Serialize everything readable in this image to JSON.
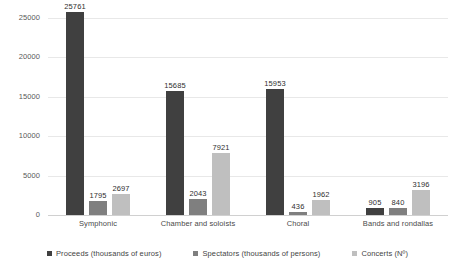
{
  "chart_data": {
    "type": "bar",
    "title": "",
    "subtitle": "",
    "xlabel": "",
    "ylabel": "",
    "ylim": [
      0,
      25000
    ],
    "ytick_values": [
      0,
      5000,
      10000,
      15000,
      20000,
      25000
    ],
    "ytick_labels": [
      "0",
      "5000",
      "10000",
      "15000",
      "20000",
      "25000"
    ],
    "grid": true,
    "legend_position": "bottom",
    "categories": [
      "Symphonic",
      "Chamber and soloists",
      "Choral",
      "Bands and rondallas"
    ],
    "series": [
      {
        "name": "Proceeds (thousands of euros)",
        "color": "#404040",
        "values": [
          25761,
          15685,
          15953,
          905
        ],
        "labels": [
          "25761",
          "15685",
          "15953",
          "905"
        ]
      },
      {
        "name": "Spectators (thousands of persons)",
        "color": "#7f7f7f",
        "values": [
          1795,
          2043,
          436,
          840
        ],
        "labels": [
          "1795",
          "2043",
          "436",
          "840"
        ]
      },
      {
        "name": "Concerts (Nº)",
        "color": "#bfbfbf",
        "values": [
          2697,
          7921,
          1962,
          3196
        ],
        "labels": [
          "2697",
          "7921",
          "1962",
          "3196"
        ]
      }
    ]
  },
  "legend": {
    "items": [
      {
        "label": "Proceeds (thousands of euros)",
        "color": "#404040"
      },
      {
        "label": "Spectators (thousands of persons)",
        "color": "#7f7f7f"
      },
      {
        "label": "Concerts (Nº)",
        "color": "#bfbfbf"
      }
    ]
  }
}
